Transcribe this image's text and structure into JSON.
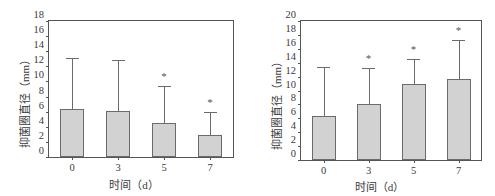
{
  "figure": {
    "panels": [
      {
        "id": "left",
        "ylabel": "抑菌圈直径（mm）",
        "xlabel": "时间（d）"
      },
      {
        "id": "right",
        "ylabel": "抑菌圈直径（mm）",
        "xlabel": "时间（d）"
      }
    ]
  },
  "chart_data": [
    {
      "type": "bar",
      "panel": "left",
      "title": "",
      "xlabel": "时间（d）",
      "ylabel": "抑菌圈直径（mm）",
      "categories": [
        "0",
        "3",
        "5",
        "7"
      ],
      "values": [
        6.35,
        6.15,
        4.5,
        2.85
      ],
      "errors_upper": [
        6.65,
        6.55,
        4.8,
        2.95
      ],
      "error_bar_tops": [
        13.0,
        12.7,
        9.3,
        5.8
      ],
      "significance_markers": [
        "",
        "",
        "*",
        "*"
      ],
      "ylim": [
        0,
        18
      ],
      "yticks": [
        0,
        2,
        4,
        6,
        8,
        10,
        12,
        14,
        16,
        18
      ],
      "ytick_labels": [
        "0",
        "2",
        "4",
        "6",
        "8",
        "10",
        "12",
        "14",
        "16",
        "18"
      ],
      "grid": false,
      "legend": "none",
      "bar_color": "#d2d2d2",
      "bar_edge_color": "#6b6b6b"
    },
    {
      "type": "bar",
      "panel": "right",
      "title": "",
      "xlabel": "时间（d）",
      "ylabel": "抑菌圈直径（mm）",
      "categories": [
        "0",
        "3",
        "5",
        "7"
      ],
      "values": [
        6.3,
        8.1,
        11.0,
        11.7
      ],
      "errors_upper": [
        6.9,
        5.0,
        3.4,
        5.4
      ],
      "error_bar_tops": [
        13.2,
        13.1,
        14.4,
        17.1
      ],
      "significance_markers": [
        "",
        "*",
        "*",
        "*"
      ],
      "ylim": [
        0,
        20
      ],
      "yticks": [
        0,
        2,
        4,
        6,
        8,
        10,
        12,
        14,
        16,
        18,
        20
      ],
      "ytick_labels": [
        "0",
        "2",
        "4",
        "6",
        "8",
        "10",
        "12",
        "14",
        "16",
        "18",
        "20"
      ],
      "grid": false,
      "legend": "none",
      "bar_color": "#d2d2d2",
      "bar_edge_color": "#6b6b6b"
    }
  ]
}
